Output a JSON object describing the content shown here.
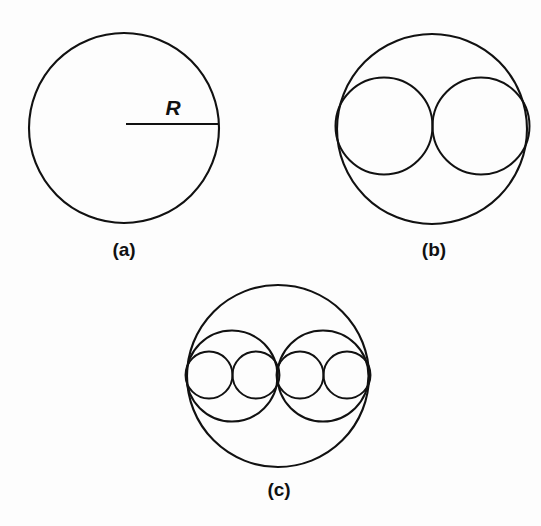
{
  "figure": {
    "background_color": "#fdfdfd",
    "stroke_color": "#111111",
    "width": 541,
    "height": 526,
    "radius_label": "R"
  },
  "panels": [
    {
      "id": "a",
      "caption": "(a)",
      "caption_x": 124,
      "caption_y": 250,
      "description": "single circle of radius R"
    },
    {
      "id": "b",
      "caption": "(b)",
      "caption_x": 434,
      "caption_y": 250,
      "description": "one circle subdivided into two tangent circles of half radius"
    },
    {
      "id": "c",
      "caption": "(c)",
      "caption_x": 279,
      "caption_y": 490,
      "description": "one circle subdivided into two then four tangent circles"
    }
  ],
  "chart_data": {
    "type": "diagram",
    "title": "",
    "subtitle": "",
    "xlabel": "",
    "ylabel": "",
    "grid": false,
    "legend": "none",
    "annotations": [
      {
        "text": "R",
        "x": 173,
        "y": 108,
        "style": "italic-bold",
        "panel": "a"
      },
      {
        "text": "(a)",
        "x": 124,
        "y": 250,
        "style": "bold",
        "panel": "a"
      },
      {
        "text": "(b)",
        "x": 434,
        "y": 250,
        "style": "bold",
        "panel": "b"
      },
      {
        "text": "(c)",
        "x": 279,
        "y": 490,
        "style": "bold",
        "panel": "c"
      }
    ],
    "panel_a": {
      "outer_circle": {
        "cx": 124,
        "cy": 128,
        "r": 95
      },
      "radius_line": {
        "x1": 126,
        "y1": 124,
        "x2": 218,
        "y2": 124
      },
      "radius_label_value": "R",
      "circle_count": 1
    },
    "panel_b": {
      "outer_circle": {
        "cx": 432,
        "cy": 129,
        "r": 95
      },
      "inner_circles": [
        {
          "cx": 384,
          "cy": 126,
          "r": 48.5
        },
        {
          "cx": 481,
          "cy": 126,
          "r": 48.5
        }
      ],
      "circle_count": 3,
      "inner_radius_ratio": 0.5
    },
    "panel_c": {
      "outer_circle": {
        "cx": 278,
        "cy": 376,
        "r": 91
      },
      "medium_circles": [
        {
          "cx": 232,
          "cy": 376,
          "r": 45.5
        },
        {
          "cx": 323,
          "cy": 376,
          "r": 45.5
        }
      ],
      "small_circles": [
        {
          "cx": 209,
          "cy": 375,
          "r": 23.5
        },
        {
          "cx": 256,
          "cy": 375,
          "r": 23.5
        },
        {
          "cx": 300,
          "cy": 375,
          "r": 23.5
        },
        {
          "cx": 347,
          "cy": 375,
          "r": 23.5
        }
      ],
      "circle_count": 7,
      "medium_radius_ratio": 0.5,
      "small_radius_ratio": 0.25
    }
  }
}
